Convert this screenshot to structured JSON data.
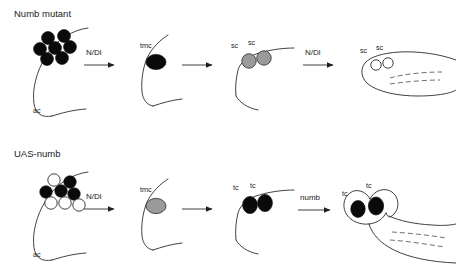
{
  "figure": {
    "title": "",
    "colors": {
      "stroke": "#2b2b2b",
      "cell_black": "#0a0a0a",
      "cell_gray": "#9a9a9a",
      "cell_white": "#ffffff",
      "background": "#ffffff"
    }
  },
  "rows": [
    {
      "id": "numb-mutant",
      "title": "Numb mutant",
      "stages": [
        {
          "id": "proneural-cluster",
          "organ_label": "ac",
          "cells": [
            {
              "label": "",
              "fill": "black"
            },
            {
              "label": "",
              "fill": "black"
            },
            {
              "label": "",
              "fill": "black"
            },
            {
              "label": "",
              "fill": "black"
            },
            {
              "label": "",
              "fill": "black"
            },
            {
              "label": "",
              "fill": "black"
            },
            {
              "label": "",
              "fill": "black"
            }
          ]
        },
        {
          "id": "tmc-stage",
          "organ_label": "",
          "cells": [
            {
              "label": "tmc",
              "fill": "black"
            }
          ]
        },
        {
          "id": "sc-gray-stage",
          "organ_label": "",
          "cells": [
            {
              "label": "sc",
              "fill": "gray"
            },
            {
              "label": "sc",
              "fill": "gray"
            }
          ]
        },
        {
          "id": "sc-socket-stage",
          "organ_label": "",
          "cells": [
            {
              "label": "sc",
              "fill": "white"
            },
            {
              "label": "sc",
              "fill": "white"
            }
          ]
        }
      ],
      "arrows": [
        {
          "label": "N/Dl"
        },
        {
          "label": ""
        },
        {
          "label": "N/Dl"
        }
      ]
    },
    {
      "id": "uas-numb",
      "title": "UAS-numb",
      "stages": [
        {
          "id": "proneural-cluster",
          "organ_label": "ac",
          "cells": [
            {
              "label": "",
              "fill": "white"
            },
            {
              "label": "",
              "fill": "black"
            },
            {
              "label": "",
              "fill": "black"
            },
            {
              "label": "",
              "fill": "black"
            },
            {
              "label": "",
              "fill": "black"
            },
            {
              "label": "",
              "fill": "white"
            },
            {
              "label": "",
              "fill": "white"
            },
            {
              "label": "",
              "fill": "white"
            }
          ]
        },
        {
          "id": "tmc-stage",
          "organ_label": "",
          "cells": [
            {
              "label": "tmc",
              "fill": "gray"
            }
          ]
        },
        {
          "id": "tc-stage",
          "organ_label": "",
          "cells": [
            {
              "label": "tc",
              "fill": "black"
            },
            {
              "label": "tc",
              "fill": "black"
            }
          ]
        },
        {
          "id": "bristle-stage",
          "organ_label": "",
          "cells": [
            {
              "label": "tc",
              "fill": "black"
            },
            {
              "label": "tc",
              "fill": "black"
            }
          ]
        }
      ],
      "arrows": [
        {
          "label": "N/Dl"
        },
        {
          "label": ""
        },
        {
          "label": "numb"
        }
      ]
    }
  ]
}
